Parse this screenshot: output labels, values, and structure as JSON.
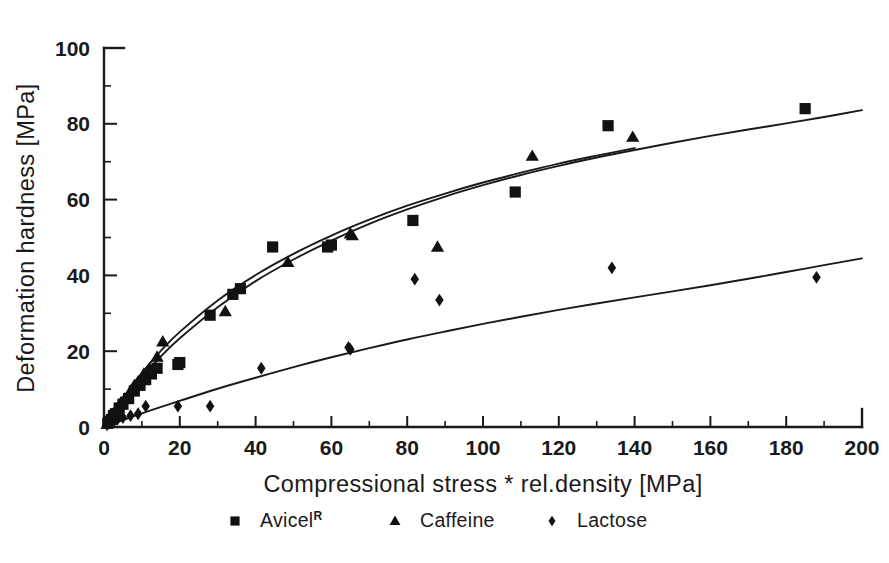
{
  "chart_data": {
    "type": "scatter",
    "title": "",
    "subtitle": "",
    "xlabel": "Compressional stress * rel.density [MPa]",
    "ylabel": "Deformation hardness [MPa]",
    "xlim": [
      0,
      200
    ],
    "ylim": [
      0,
      100
    ],
    "xticks": [
      0,
      20,
      40,
      60,
      80,
      100,
      120,
      140,
      160,
      180,
      200
    ],
    "xtick_labels": [
      "0",
      "20",
      "40",
      "60",
      "80",
      "100",
      "120",
      "140",
      "160",
      "180",
      "200"
    ],
    "yticks": [
      0,
      20,
      40,
      60,
      80,
      100
    ],
    "ytick_labels": [
      "0",
      "20",
      "40",
      "60",
      "80",
      "100"
    ],
    "grid": false,
    "legend_position": "below-axes",
    "legend": [
      {
        "label": "Avicel",
        "superscript": "R",
        "marker": "square",
        "color": "#111111"
      },
      {
        "label": "Caffeine",
        "superscript": "",
        "marker": "triangle",
        "color": "#111111"
      },
      {
        "label": "Lactose",
        "superscript": "",
        "marker": "diamond",
        "color": "#111111"
      }
    ],
    "series": [
      {
        "name": "Avicel",
        "marker": "square",
        "color": "#111111",
        "points": [
          [
            1.0,
            1.0
          ],
          [
            1.5,
            1.5
          ],
          [
            2.0,
            2.0
          ],
          [
            2.5,
            3.0
          ],
          [
            3.0,
            3.5
          ],
          [
            4.0,
            5.0
          ],
          [
            5.0,
            6.0
          ],
          [
            6.5,
            7.5
          ],
          [
            8.0,
            9.5
          ],
          [
            9.5,
            11.0
          ],
          [
            11.0,
            12.5
          ],
          [
            12.5,
            14.0
          ],
          [
            14.0,
            15.5
          ],
          [
            19.5,
            16.5
          ],
          [
            20.0,
            17.0
          ],
          [
            28.0,
            29.5
          ],
          [
            34.0,
            35.0
          ],
          [
            36.0,
            36.5
          ],
          [
            44.5,
            47.5
          ],
          [
            59.0,
            47.5
          ],
          [
            60.0,
            48.0
          ],
          [
            81.5,
            54.5
          ],
          [
            108.5,
            62.0
          ],
          [
            133.0,
            79.5
          ],
          [
            185.0,
            84.0
          ]
        ],
        "fit_curve": {
          "model": "a*(1-exp(-b*x)) saturating",
          "x_range": [
            0,
            200
          ],
          "samples": [
            [
              0,
              0
            ],
            [
              5,
              7.0
            ],
            [
              10,
              13.2
            ],
            [
              15,
              18.6
            ],
            [
              20,
              23.4
            ],
            [
              30,
              31.6
            ],
            [
              40,
              38.5
            ],
            [
              50,
              44.2
            ],
            [
              60,
              49.2
            ],
            [
              70,
              53.6
            ],
            [
              80,
              57.4
            ],
            [
              90,
              60.8
            ],
            [
              100,
              63.8
            ],
            [
              110,
              66.5
            ],
            [
              120,
              68.9
            ],
            [
              130,
              71.1
            ],
            [
              140,
              73.1
            ],
            [
              150,
              75.0
            ],
            [
              160,
              76.8
            ],
            [
              170,
              78.5
            ],
            [
              180,
              80.1
            ],
            [
              190,
              81.8
            ],
            [
              200,
              83.6
            ]
          ]
        }
      },
      {
        "name": "Caffeine",
        "marker": "triangle",
        "color": "#111111",
        "points": [
          [
            0.8,
            0.8
          ],
          [
            1.5,
            1.8
          ],
          [
            2.0,
            2.5
          ],
          [
            2.5,
            3.5
          ],
          [
            3.5,
            5.0
          ],
          [
            4.5,
            6.5
          ],
          [
            5.5,
            7.5
          ],
          [
            7.0,
            9.5
          ],
          [
            8.0,
            11.0
          ],
          [
            9.0,
            12.0
          ],
          [
            10.5,
            14.0
          ],
          [
            12.0,
            15.5
          ],
          [
            14.0,
            18.5
          ],
          [
            15.5,
            22.5
          ],
          [
            32.0,
            30.5
          ],
          [
            48.5,
            43.5
          ],
          [
            65.0,
            51.0
          ],
          [
            65.5,
            50.5
          ],
          [
            88.0,
            47.5
          ],
          [
            113.0,
            71.5
          ],
          [
            139.5,
            76.5
          ]
        ],
        "fit_curve": {
          "model": "a*(1-exp(-b*x)) saturating",
          "x_range": [
            0,
            140
          ],
          "samples": [
            [
              0,
              0
            ],
            [
              5,
              7.6
            ],
            [
              10,
              14.3
            ],
            [
              15,
              20.1
            ],
            [
              20,
              25.1
            ],
            [
              30,
              33.4
            ],
            [
              40,
              40.1
            ],
            [
              50,
              45.7
            ],
            [
              60,
              50.5
            ],
            [
              70,
              54.7
            ],
            [
              80,
              58.4
            ],
            [
              90,
              61.6
            ],
            [
              100,
              64.5
            ],
            [
              110,
              67.1
            ],
            [
              120,
              69.5
            ],
            [
              130,
              71.6
            ],
            [
              140,
              73.6
            ]
          ]
        }
      },
      {
        "name": "Lactose",
        "marker": "diamond",
        "color": "#111111",
        "points": [
          [
            0.8,
            0.6
          ],
          [
            1.5,
            1.0
          ],
          [
            2.5,
            1.5
          ],
          [
            3.5,
            2.0
          ],
          [
            5.0,
            2.5
          ],
          [
            7.0,
            3.0
          ],
          [
            9.0,
            3.5
          ],
          [
            11.0,
            5.5
          ],
          [
            19.5,
            5.5
          ],
          [
            28.0,
            5.5
          ],
          [
            41.5,
            15.5
          ],
          [
            64.5,
            21.0
          ],
          [
            65.0,
            20.5
          ],
          [
            82.0,
            39.0
          ],
          [
            88.5,
            33.5
          ],
          [
            134.0,
            42.0
          ],
          [
            188.0,
            39.5
          ]
        ],
        "fit_curve": {
          "model": "a*(1-exp(-b*x)) saturating",
          "x_range": [
            0,
            200
          ],
          "samples": [
            [
              0,
              0
            ],
            [
              10,
              3.6
            ],
            [
              20,
              6.9
            ],
            [
              30,
              10.1
            ],
            [
              40,
              13.0
            ],
            [
              50,
              15.8
            ],
            [
              60,
              18.4
            ],
            [
              70,
              20.8
            ],
            [
              80,
              23.1
            ],
            [
              90,
              25.2
            ],
            [
              100,
              27.2
            ],
            [
              110,
              29.1
            ],
            [
              120,
              30.9
            ],
            [
              130,
              32.6
            ],
            [
              140,
              34.2
            ],
            [
              150,
              35.8
            ],
            [
              160,
              37.4
            ],
            [
              170,
              39.1
            ],
            [
              180,
              40.9
            ],
            [
              190,
              42.7
            ],
            [
              200,
              44.5
            ]
          ]
        }
      }
    ]
  }
}
